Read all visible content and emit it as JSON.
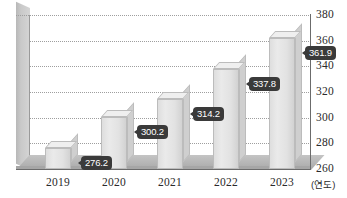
{
  "chart_data": {
    "type": "bar",
    "title": "",
    "xlabel": "(연도)",
    "ylabel": "",
    "categories": [
      "2019",
      "2020",
      "2021",
      "2022",
      "2023"
    ],
    "values": [
      276.2,
      300.2,
      314.2,
      337.8,
      361.9
    ],
    "value_labels": [
      "276.2",
      "300.2",
      "314.2",
      "337.8",
      "361.9"
    ],
    "ylim": [
      260,
      380
    ],
    "yticks": [
      380,
      360,
      340,
      320,
      300,
      280,
      260
    ],
    "ytick_labels": [
      "380",
      "360",
      "340",
      "320",
      "300",
      "280",
      "260"
    ],
    "grid": true,
    "grid_style": "dotted-horizontal",
    "legend": "none",
    "y_axis_position": "right",
    "style_3d": true,
    "colors": {
      "bar_face": "#e6e6e6",
      "bar_top": "#efefef",
      "bar_side": "#cfcfcf",
      "bar_border": "#bcbcbc",
      "wall": "#c9c9c9",
      "floor": "#b5b5b5",
      "grid": "#9e9e9e",
      "axis": "#6b6b6b",
      "label_bg": "#3a3a3a",
      "label_text": "#ffffff",
      "tick_text": "#2a2a2a",
      "background": "#ffffff"
    }
  }
}
